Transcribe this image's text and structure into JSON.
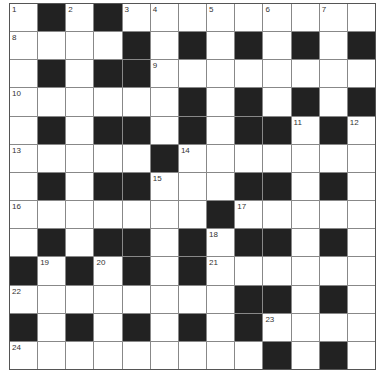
{
  "puzzle": {
    "rows": 13,
    "cols": 13,
    "grid": [
      [
        "1",
        "#",
        "2",
        "#",
        "3",
        "4",
        ".",
        "5",
        ".",
        "6",
        ".",
        "7",
        "."
      ],
      [
        "8",
        ".",
        ".",
        ".",
        "#",
        ".",
        "#",
        ".",
        "#",
        ".",
        "#",
        ".",
        "#"
      ],
      [
        ".",
        "#",
        ".",
        "#",
        "#",
        "9",
        ".",
        ".",
        ".",
        ".",
        ".",
        ".",
        "."
      ],
      [
        "10",
        ".",
        ".",
        ".",
        ".",
        ".",
        "#",
        ".",
        "#",
        ".",
        "#",
        ".",
        "#"
      ],
      [
        ".",
        "#",
        ".",
        "#",
        "#",
        ".",
        "#",
        ".",
        "#",
        "#",
        "11",
        "#",
        "12"
      ],
      [
        "13",
        ".",
        ".",
        ".",
        ".",
        "#",
        "14",
        ".",
        ".",
        ".",
        ".",
        ".",
        "."
      ],
      [
        ".",
        "#",
        ".",
        "#",
        "#",
        "15",
        ".",
        ".",
        "#",
        "#",
        ".",
        "#",
        "."
      ],
      [
        "16",
        ".",
        ".",
        ".",
        ".",
        ".",
        ".",
        "#",
        "17",
        ".",
        ".",
        ".",
        "."
      ],
      [
        ".",
        "#",
        ".",
        "#",
        "#",
        ".",
        "#",
        "18",
        "#",
        "#",
        ".",
        "#",
        "."
      ],
      [
        "#",
        "19",
        "#",
        "20",
        "#",
        ".",
        "#",
        "21",
        ".",
        ".",
        ".",
        ".",
        "."
      ],
      [
        "22",
        ".",
        ".",
        ".",
        ".",
        ".",
        ".",
        ".",
        "#",
        "#",
        ".",
        "#",
        "."
      ],
      [
        "#",
        ".",
        "#",
        ".",
        "#",
        ".",
        "#",
        ".",
        "#",
        "23",
        ".",
        ".",
        "."
      ],
      [
        "24",
        ".",
        ".",
        ".",
        ".",
        ".",
        ".",
        ".",
        ".",
        "#",
        ".",
        "#",
        "."
      ]
    ],
    "colors": {
      "block": "#222222",
      "cell": "#ffffff",
      "line": "#888888"
    }
  }
}
